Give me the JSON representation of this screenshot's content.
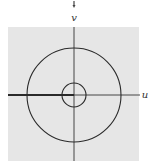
{
  "diagram": {
    "type": "complex-plane-annulus",
    "axes": {
      "horizontal_label": "u",
      "vertical_label": "v"
    },
    "plane": {
      "background_color": "#e6e6e6",
      "x": 8,
      "y": 27,
      "width": 131,
      "height": 134
    },
    "origin": {
      "x": 74,
      "y": 95
    },
    "circles": [
      {
        "name": "outer-circle",
        "radius": 47
      },
      {
        "name": "inner-circle",
        "radius": 12
      }
    ],
    "branch_cut": {
      "description": "thick segment along negative u-axis",
      "from_x": 8,
      "to_x": 74
    },
    "colors": {
      "stroke": "#2a2a2a",
      "axis": "#333333",
      "plane": "#e6e6e6"
    },
    "top_marker": {
      "symbol": "down-arrow",
      "x": 74,
      "y": 2
    }
  }
}
